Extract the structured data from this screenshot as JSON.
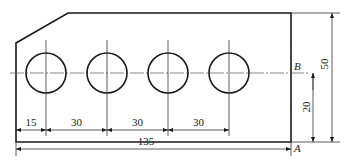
{
  "drawing": {
    "type": "mechanical-plate-with-holes",
    "colors": {
      "line": "#1a1a1a",
      "thin": "#333333",
      "background": "#ffffff"
    },
    "outline": {
      "points": [
        [
          16,
          43
        ],
        [
          68,
          13
        ],
        [
          291,
          13
        ],
        [
          291,
          142
        ],
        [
          16,
          142
        ]
      ]
    },
    "centerline_y": 73,
    "holes": [
      {
        "cx": 46,
        "cy": 73,
        "r": 20
      },
      {
        "cx": 107,
        "cy": 73,
        "r": 20
      },
      {
        "cx": 168,
        "cy": 73,
        "r": 20
      },
      {
        "cx": 229,
        "cy": 73,
        "r": 20
      }
    ],
    "datum_labels": {
      "B": "B",
      "A": "A"
    },
    "dimensions": {
      "horizontal": [
        {
          "label": "15",
          "x1": 16,
          "x2": 46,
          "y": 130
        },
        {
          "label": "30",
          "x1": 46,
          "x2": 107,
          "y": 130
        },
        {
          "label": "30",
          "x1": 107,
          "x2": 168,
          "y": 130
        },
        {
          "label": "30",
          "x1": 168,
          "x2": 229,
          "y": 130
        }
      ],
      "overall": {
        "label": "135",
        "x1": 16,
        "x2": 291,
        "y": 149
      },
      "vertical": [
        {
          "label": "20",
          "x": 313,
          "y1": 73,
          "y2": 142
        },
        {
          "label": "50",
          "x": 332,
          "y1": 13,
          "y2": 142
        }
      ]
    }
  }
}
